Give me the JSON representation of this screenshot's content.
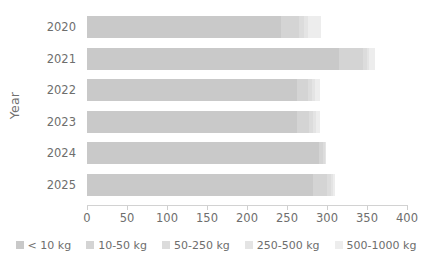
{
  "chart_data": {
    "type": "bar",
    "subtype": "horizontal-stacked-bar",
    "title": "",
    "xlabel": "",
    "ylabel": "Year",
    "categories": [
      "2020",
      "2021",
      "2022",
      "2023",
      "2024",
      "2025"
    ],
    "xlim": [
      0,
      400
    ],
    "xticks": [
      0,
      50,
      100,
      150,
      200,
      250,
      300,
      350,
      400
    ],
    "xtick_labels": [
      "0",
      "50",
      "100",
      "150",
      "200",
      "250",
      "300",
      "350",
      "400"
    ],
    "grid": false,
    "legend_position": "bottom",
    "series": [
      {
        "name": "< 10 kg",
        "color": "#c9c9c9",
        "values": [
          243,
          315,
          262,
          263,
          290,
          283
        ]
      },
      {
        "name": "10-50 kg",
        "color": "#d4d4d4",
        "values": [
          22,
          30,
          14,
          14,
          5,
          17
        ]
      },
      {
        "name": "50-250 kg",
        "color": "#dcdcdc",
        "values": [
          6,
          5,
          5,
          5,
          2,
          5
        ]
      },
      {
        "name": "250-500 kg",
        "color": "#e4e4e4",
        "values": [
          5,
          3,
          4,
          4,
          1,
          3
        ]
      },
      {
        "name": "500-1000 kg",
        "color": "#ededed",
        "values": [
          17,
          7,
          6,
          5,
          0,
          2
        ]
      }
    ],
    "totals": [
      293,
      360,
      291,
      291,
      298,
      310
    ]
  },
  "axes": {
    "y_title": "Year"
  },
  "legend": {
    "items": [
      {
        "label": "< 10 kg",
        "color": "#c9c9c9"
      },
      {
        "label": "10-50 kg",
        "color": "#d4d4d4"
      },
      {
        "label": "50-250 kg",
        "color": "#dcdcdc"
      },
      {
        "label": "250-500 kg",
        "color": "#e4e4e4"
      },
      {
        "label": "500-1000 kg",
        "color": "#ededed"
      }
    ]
  }
}
